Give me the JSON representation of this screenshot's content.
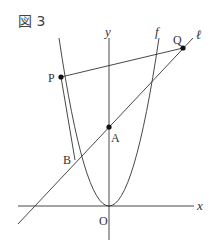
{
  "figure": {
    "title": "図 3",
    "labels": {
      "y_axis": "y",
      "x_axis": "x",
      "curve": "f",
      "line": "ℓ",
      "origin": "O",
      "point_p": "P",
      "point_q": "Q",
      "point_a": "A",
      "point_b": "B"
    },
    "colors": {
      "stroke": "#333333",
      "point": "#111111"
    }
  }
}
